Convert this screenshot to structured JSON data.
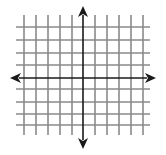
{
  "figure": {
    "width": 166,
    "height": 155,
    "background": "#ffffff"
  },
  "grid": {
    "color": "#8a8a8a",
    "line_width": 1.6,
    "x_extent": [
      16,
      150
    ],
    "y_extent": [
      15,
      135
    ],
    "vertical_lines": [
      24,
      36,
      48,
      60,
      72,
      95,
      107,
      119,
      131,
      143
    ],
    "horizontal_lines": [
      27,
      40,
      53,
      65,
      89,
      102,
      114,
      125
    ]
  },
  "axes": {
    "color": "#1a1a1a",
    "line_width": 1.6,
    "origin": [
      83,
      78
    ],
    "x_axis": {
      "from": 10,
      "to": 156,
      "arrows": [
        "left-arrow-icon",
        "right-arrow-icon"
      ]
    },
    "y_axis": {
      "from": 6,
      "to": 149,
      "arrows": [
        "up-arrow-icon",
        "down-arrow-icon"
      ]
    },
    "arrowhead": {
      "length": 11,
      "half_width": 5
    }
  }
}
